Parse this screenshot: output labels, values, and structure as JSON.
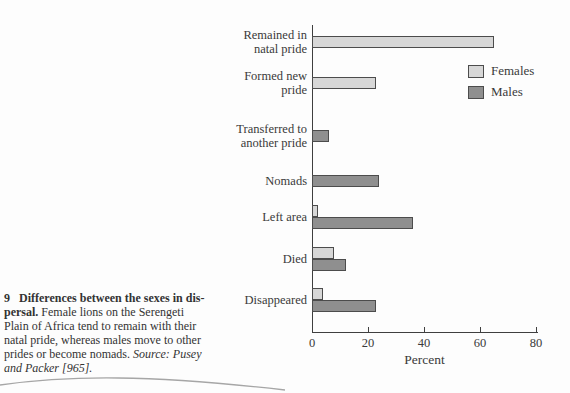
{
  "figure": {
    "caption": {
      "lines": [
        [
          {
            "text": "9   Differences between the sexes in dis-",
            "style": "bold"
          }
        ],
        [
          {
            "text": "persal.",
            "style": "bold"
          },
          {
            "text": " Female lions on the Serengeti",
            "style": "normal"
          }
        ],
        [
          {
            "text": "Plain of Africa tend to remain with their",
            "style": "normal"
          }
        ],
        [
          {
            "text": "natal pride, whereas males move to other",
            "style": "normal"
          }
        ],
        [
          {
            "text": "prides or become nomads. ",
            "style": "normal"
          },
          {
            "text": "Source: Pusey",
            "style": "italic"
          }
        ],
        [
          {
            "text": "and Packer [965].",
            "style": "italic"
          }
        ]
      ]
    }
  },
  "chart_data": {
    "type": "bar",
    "orientation": "horizontal",
    "categories": [
      "Remained in\nnatal pride",
      "Formed new\npride",
      "Transferred to\nanother pride",
      "Nomads",
      "Left area",
      "Died",
      "Disappeared"
    ],
    "series": [
      {
        "name": "Females",
        "color": "#d7d7d7",
        "values": [
          65,
          23,
          null,
          null,
          2,
          8,
          4
        ]
      },
      {
        "name": "Males",
        "color": "#8f8f8f",
        "values": [
          null,
          null,
          6,
          24,
          36,
          12,
          23
        ]
      }
    ],
    "xlabel": "Percent",
    "xlim": [
      0,
      80
    ],
    "x_ticks": [
      0,
      20,
      40,
      60,
      80
    ],
    "legend_position": "upper right",
    "grid": false
  }
}
